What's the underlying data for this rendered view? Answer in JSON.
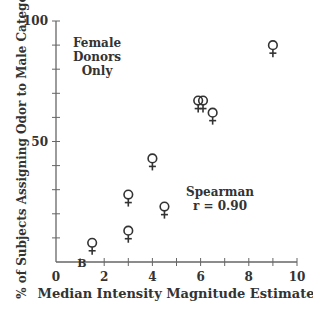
{
  "chart_data": {
    "type": "scatter",
    "title": "",
    "xlabel": "Median Intensity Magnitude Estimate",
    "ylabel": "% of Subjects Assigning Odor to Male Category",
    "xlim": [
      0,
      10
    ],
    "ylim": [
      0,
      100
    ],
    "x_ticks": [
      "0",
      "2",
      "4",
      "6",
      "8",
      "10"
    ],
    "y_ticks": [
      "50",
      "100"
    ],
    "grid": false,
    "marker": "female-symbol",
    "points": [
      {
        "x": 1.5,
        "y": 3
      },
      {
        "x": 3.0,
        "y": 8
      },
      {
        "x": 3.0,
        "y": 23
      },
      {
        "x": 4.0,
        "y": 38
      },
      {
        "x": 4.5,
        "y": 18
      },
      {
        "x": 5.9,
        "y": 62
      },
      {
        "x": 6.1,
        "y": 62
      },
      {
        "x": 6.5,
        "y": 57
      },
      {
        "x": 9.0,
        "y": 85
      }
    ],
    "annotations": [
      {
        "text": "Female Donors Only",
        "lines": [
          "Female",
          "Donors",
          "Only"
        ]
      },
      {
        "text": "Spearman r = 0.90",
        "lines": [
          "Spearman",
          "r = 0.90"
        ]
      },
      {
        "text": "B",
        "x": 1.0,
        "y": 0
      }
    ]
  },
  "labels": {
    "xlabel": "Median Intensity Magnitude Estimate",
    "ylabel": "% of Subjects Assigning Odor to Male Category",
    "legend1": "Female",
    "legend2": "Donors",
    "legend3": "Only",
    "stat1": "Spearman",
    "stat2": "r = 0.90",
    "baseline_marker": "B",
    "marker_glyph": "♀"
  }
}
